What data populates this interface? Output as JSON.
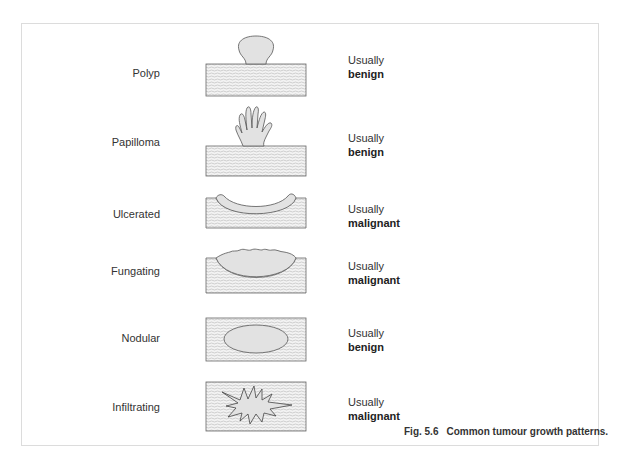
{
  "figure": {
    "caption_number": "Fig. 5.6",
    "caption_text": "Common tumour growth patterns.",
    "colors": {
      "tissue_fill": "#f2f2f2",
      "tissue_hatch": "#b8b8b8",
      "tumour_fill": "#e2e2e2",
      "outline": "#555555",
      "frame_border": "#dcdcdc"
    },
    "rows": [
      {
        "pattern": "Polyp",
        "prefix": "Usually",
        "nature": "benign"
      },
      {
        "pattern": "Papilloma",
        "prefix": "Usually",
        "nature": "benign"
      },
      {
        "pattern": "Ulcerated",
        "prefix": "Usually",
        "nature": "malignant"
      },
      {
        "pattern": "Fungating",
        "prefix": "Usually",
        "nature": "malignant"
      },
      {
        "pattern": "Nodular",
        "prefix": "Usually",
        "nature": "benign"
      },
      {
        "pattern": "Infiltrating",
        "prefix": "Usually",
        "nature": "malignant"
      }
    ]
  }
}
